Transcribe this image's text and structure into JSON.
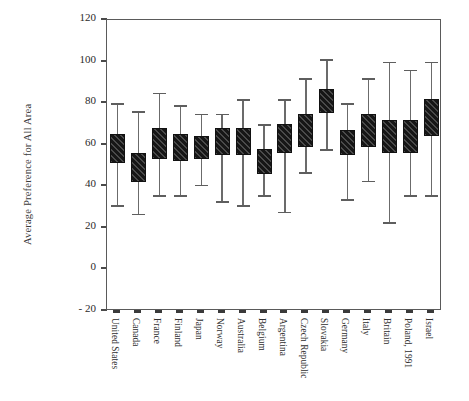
{
  "chart_data": {
    "type": "box",
    "title": "",
    "xlabel": "",
    "ylabel": "Average Preference for All Area",
    "ylim": [
      -20,
      120
    ],
    "ytick_values": [
      -20,
      0,
      20,
      40,
      60,
      80,
      100,
      120
    ],
    "ytick_labels": [
      "- 20",
      "0",
      "20",
      "40",
      "60",
      "80",
      "100",
      "120"
    ],
    "grid": false,
    "legend": null,
    "categories": [
      "United States",
      "Canada",
      "France",
      "Finland",
      "Japan",
      "Norway",
      "Australia",
      "Belgium",
      "Argentina",
      "Czech Republic",
      "Slovakia",
      "Germany",
      "Italy",
      "Britain",
      "Poland, 1991",
      "Israel"
    ],
    "boxes": [
      {
        "category": "United States",
        "whisker_low": 30,
        "q1": 52,
        "q3": 65,
        "whisker_high": 80
      },
      {
        "category": "Canada",
        "whisker_low": 26,
        "q1": 43,
        "q3": 56,
        "whisker_high": 76
      },
      {
        "category": "France",
        "whisker_low": 35,
        "q1": 54,
        "q3": 68,
        "whisker_high": 85
      },
      {
        "category": "Finland",
        "whisker_low": 35,
        "q1": 53,
        "q3": 65,
        "whisker_high": 79
      },
      {
        "category": "Japan",
        "whisker_low": 40,
        "q1": 54,
        "q3": 64,
        "whisker_high": 75
      },
      {
        "category": "Norway",
        "whisker_low": 32,
        "q1": 56,
        "q3": 68,
        "whisker_high": 75
      },
      {
        "category": "Australia",
        "whisker_low": 30,
        "q1": 56,
        "q3": 68,
        "whisker_high": 82
      },
      {
        "category": "Belgium",
        "whisker_low": 35,
        "q1": 47,
        "q3": 58,
        "whisker_high": 70
      },
      {
        "category": "Argentina",
        "whisker_low": 27,
        "q1": 57,
        "q3": 70,
        "whisker_high": 82
      },
      {
        "category": "Czech Republic",
        "whisker_low": 46,
        "q1": 60,
        "q3": 75,
        "whisker_high": 92
      },
      {
        "category": "Slovakia",
        "whisker_low": 57,
        "q1": 76,
        "q3": 87,
        "whisker_high": 101
      },
      {
        "category": "Germany",
        "whisker_low": 33,
        "q1": 56,
        "q3": 67,
        "whisker_high": 80
      },
      {
        "category": "Italy",
        "whisker_low": 42,
        "q1": 60,
        "q3": 75,
        "whisker_high": 92
      },
      {
        "category": "Britain",
        "whisker_low": 22,
        "q1": 57,
        "q3": 72,
        "whisker_high": 100
      },
      {
        "category": "Poland, 1991",
        "whisker_low": 35,
        "q1": 57,
        "q3": 72,
        "whisker_high": 96
      },
      {
        "category": "Israel",
        "whisker_low": 35,
        "q1": 65,
        "q3": 82,
        "whisker_high": 100
      }
    ]
  }
}
